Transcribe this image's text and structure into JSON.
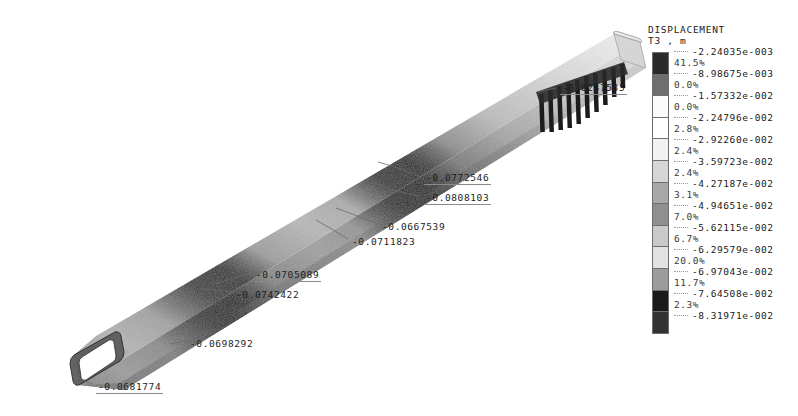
{
  "viewport": {
    "background": "#ffffff",
    "model_name": "deformed-beam-tube"
  },
  "legend": {
    "title_line1": "DISPLACEMENT",
    "title_line2": "T3 , m",
    "values": [
      "-2.24035e-003",
      "-8.98675e-003",
      "-1.57332e-002",
      "-2.24796e-002",
      "-2.92260e-002",
      "-3.59723e-002",
      "-4.27187e-002",
      "-4.94651e-002",
      "-5.62115e-002",
      "-6.29579e-002",
      "-6.97043e-002",
      "-7.64508e-002",
      "-8.31971e-002"
    ],
    "percents": [
      "41.5%",
      "0.0%",
      "0.0%",
      "2.8%",
      "2.4%",
      "2.4%",
      "3.1%",
      "7.0%",
      "6.7%",
      "20.0%",
      "11.7%",
      "2.3%"
    ],
    "band_colors": [
      "#2b2b2b",
      "#6e6e6e",
      "#fbfbfb",
      "#ffffff",
      "#f2f2f2",
      "#d6d6d6",
      "#a8a8a8",
      "#8f8f8f",
      "#c9c9c9",
      "#e2e2e2",
      "#9c9c9c",
      "#1a1a1a",
      "#333333"
    ]
  },
  "annotations": [
    {
      "id": "node-tip-right",
      "label": "-0.0287535",
      "x": 560,
      "y": 82,
      "boxed": true
    },
    {
      "id": "node-mid-upper-a",
      "label": "-0.0772546",
      "x": 424,
      "y": 172,
      "boxed": true
    },
    {
      "id": "node-mid-upper-b",
      "label": "-0.0808103",
      "x": 424,
      "y": 192,
      "boxed": true
    },
    {
      "id": "node-mid-lower-a",
      "label": "-0.0667539",
      "x": 382,
      "y": 221,
      "boxed": false
    },
    {
      "id": "node-mid-lower-b",
      "label": "-0.0711823",
      "x": 352,
      "y": 236,
      "boxed": false
    },
    {
      "id": "node-left-upper",
      "label": "-0.0705089",
      "x": 254,
      "y": 269,
      "boxed": true
    },
    {
      "id": "node-left-lower",
      "label": "-0.0742422",
      "x": 236,
      "y": 289,
      "boxed": false
    },
    {
      "id": "node-beam-mid",
      "label": "-0.0698292",
      "x": 190,
      "y": 338,
      "boxed": false
    },
    {
      "id": "node-tip-left",
      "label": "-0.0681774",
      "x": 96,
      "y": 381,
      "boxed": true
    }
  ]
}
